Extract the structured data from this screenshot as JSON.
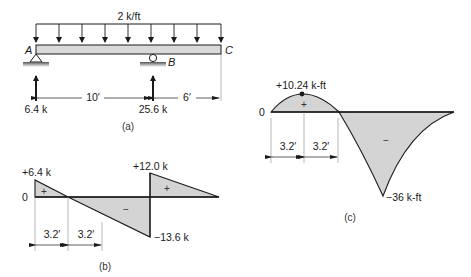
{
  "figure_a": {
    "load_label": "2 k/ft",
    "point_a": "A",
    "point_b": "B",
    "point_c": "C",
    "reaction_a": "6.4 k",
    "reaction_b": "25.6 k",
    "span_ab": "10′",
    "span_bc": "6′",
    "caption": "(a)"
  },
  "figure_b": {
    "zero_label": "0",
    "max_left": "+6.4 k",
    "min_label": "−13.6 k",
    "max_right": "+12.0 k",
    "plus_sign": "+",
    "minus_sign": "−",
    "dim_1": "3.2′",
    "dim_2": "3.2′",
    "caption": "(b)"
  },
  "figure_c": {
    "zero_label": "0",
    "max_label": "+10.24 k-ft",
    "min_label": "−36 k-ft",
    "plus_sign": "+",
    "minus_sign": "−",
    "dim_1": "3.2′",
    "dim_2": "3.2′",
    "caption": "(c)"
  },
  "colors": {
    "fill": "#d4d4d4",
    "line": "#1a1a1a",
    "beam": "#d9d9d9"
  }
}
